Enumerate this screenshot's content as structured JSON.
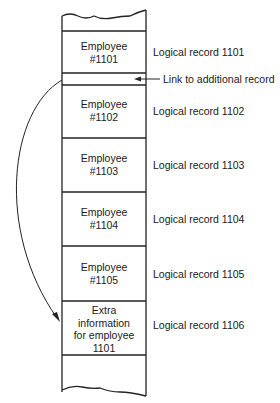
{
  "diagram": {
    "records": [
      {
        "cell_lines": [
          "Employee",
          "#1101"
        ],
        "label": "Logical record 1101"
      },
      {
        "cell_lines": [
          "Employee",
          "#1102"
        ],
        "label": "Logical record 1102"
      },
      {
        "cell_lines": [
          "Employee",
          "#1103"
        ],
        "label": "Logical record 1103"
      },
      {
        "cell_lines": [
          "Employee",
          "#1104"
        ],
        "label": "Logical record 1104"
      },
      {
        "cell_lines": [
          "Employee",
          "#1105"
        ],
        "label": "Logical record 1105"
      },
      {
        "cell_lines": [
          "Extra",
          "information",
          "for employee",
          "1101"
        ],
        "label": "Logical record 1106"
      }
    ],
    "link_label": "Link to additional record"
  }
}
